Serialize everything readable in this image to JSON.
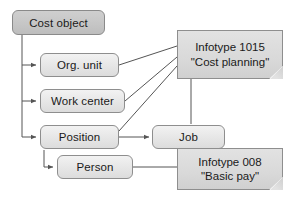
{
  "diagram": {
    "type": "hierarchy-flow",
    "colors": {
      "line": "#555555",
      "node_fill": "#e6e6e6",
      "root_fill": "#c6c6c6",
      "note_fill": "#d9d9d9",
      "border": "#8e8e8e",
      "text": "#1a1a1a",
      "background": "#ffffff"
    },
    "nodes": [
      {
        "id": "cost-object",
        "label": "Cost object",
        "style": "dark"
      },
      {
        "id": "org-unit",
        "label": "Org. unit",
        "style": "plain"
      },
      {
        "id": "work-center",
        "label": "Work center",
        "style": "plain"
      },
      {
        "id": "position",
        "label": "Position",
        "style": "plain"
      },
      {
        "id": "person",
        "label": "Person",
        "style": "plain"
      },
      {
        "id": "job",
        "label": "Job",
        "style": "plain"
      }
    ],
    "notes": [
      {
        "id": "infotype-1015",
        "line1": "Infotype 1015",
        "line2": "\"Cost planning\""
      },
      {
        "id": "infotype-008",
        "line1": "Infotype 008",
        "line2": "\"Basic pay\""
      }
    ],
    "edges": [
      {
        "from": "cost-object",
        "to": "org-unit",
        "kind": "arrow"
      },
      {
        "from": "cost-object",
        "to": "work-center",
        "kind": "arrow"
      },
      {
        "from": "cost-object",
        "to": "position",
        "kind": "arrow"
      },
      {
        "from": "position",
        "to": "person",
        "kind": "arrow"
      },
      {
        "from": "position",
        "to": "job",
        "kind": "arrow"
      },
      {
        "from": "org-unit",
        "to": "infotype-1015",
        "kind": "line"
      },
      {
        "from": "work-center",
        "to": "infotype-1015",
        "kind": "line"
      },
      {
        "from": "position",
        "to": "infotype-1015",
        "kind": "line"
      },
      {
        "from": "infotype-1015",
        "to": "job",
        "kind": "line"
      },
      {
        "from": "person",
        "to": "infotype-008",
        "kind": "line"
      }
    ]
  }
}
